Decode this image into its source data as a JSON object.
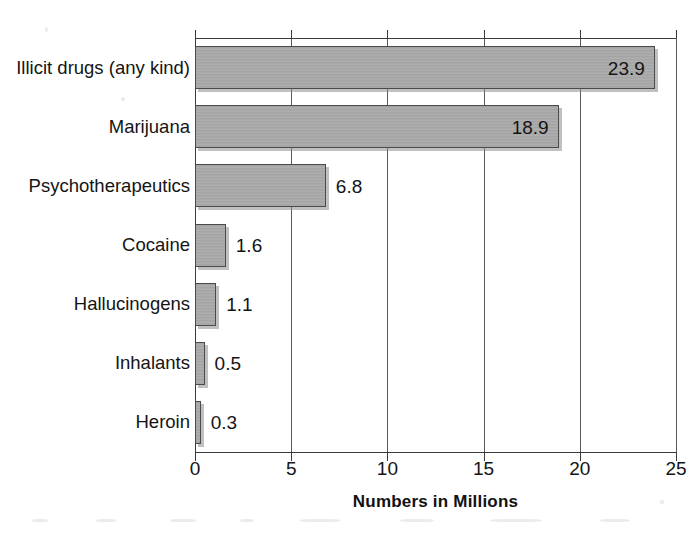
{
  "chart_data": {
    "type": "bar",
    "orientation": "horizontal",
    "title": "",
    "xlabel": "Numbers in Millions",
    "ylabel": "",
    "xlim": [
      0,
      25
    ],
    "xticks": [
      0,
      5,
      10,
      15,
      20,
      25
    ],
    "xtick_labels": [
      "0",
      "5",
      "10",
      "15",
      "20",
      "25"
    ],
    "grid": true,
    "grid_axis": "x",
    "legend": false,
    "bar_color": "#a9a9a9",
    "bar_edge_color": "#4a4a4a",
    "categories": [
      "Illicit drugs (any kind)",
      "Marijuana",
      "Psychotherapeutics",
      "Cocaine",
      "Hallucinogens",
      "Inhalants",
      "Heroin"
    ],
    "values": [
      23.9,
      18.9,
      6.8,
      1.6,
      1.1,
      0.5,
      0.3
    ],
    "value_labels": [
      "23.9",
      "18.9",
      "6.8",
      "1.6",
      "1.1",
      "0.5",
      "0.3"
    ],
    "label_placement": [
      "inside",
      "inside",
      "outside",
      "outside",
      "outside",
      "outside",
      "outside"
    ],
    "bars": [
      {
        "category": "Illicit drugs (any kind)",
        "value": 23.9,
        "label": "23.9",
        "placement": "inside"
      },
      {
        "category": "Marijuana",
        "value": 18.9,
        "label": "18.9",
        "placement": "inside"
      },
      {
        "category": "Psychotherapeutics",
        "value": 6.8,
        "label": "6.8",
        "placement": "outside"
      },
      {
        "category": "Cocaine",
        "value": 1.6,
        "label": "1.6",
        "placement": "outside"
      },
      {
        "category": "Hallucinogens",
        "value": 1.1,
        "label": "1.1",
        "placement": "outside"
      },
      {
        "category": "Inhalants",
        "value": 0.5,
        "label": "0.5",
        "placement": "outside"
      },
      {
        "category": "Heroin",
        "value": 0.3,
        "label": "0.3",
        "placement": "outside"
      }
    ]
  }
}
